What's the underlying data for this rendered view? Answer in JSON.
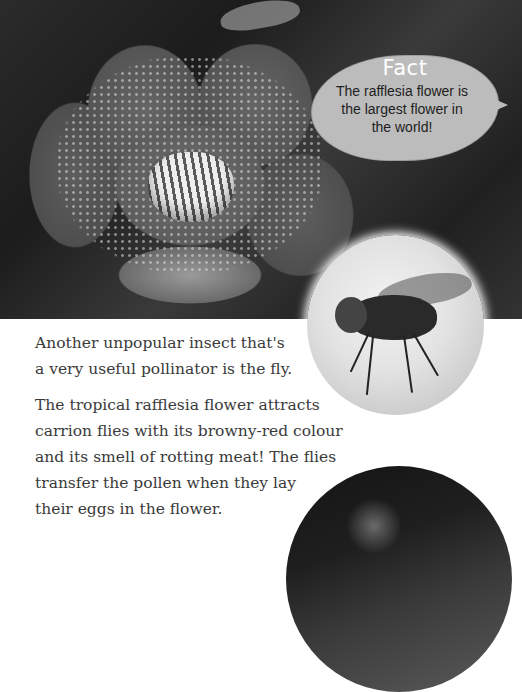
{
  "fact_box": {
    "title": "Fact",
    "text": "The rafflesia flower is the largest flower in the world!",
    "lines": [
      "The rafflesia flower is",
      "the largest flower in",
      "the world!"
    ]
  },
  "images": {
    "top_photo": "rafflesia-flower-photo",
    "fly_photo": "housefly-photo",
    "bottom_photo": "fly-on-flower-photo"
  },
  "body": {
    "paragraphs": [
      {
        "text": "Another unpopular insect that's a very useful pollinator is the fly.",
        "lines": [
          "Another unpopular insect that's",
          "a very useful pollinator is the fly."
        ]
      },
      {
        "text": "The tropical rafflesia flower attracts carrion flies with its browny-red colour and its smell of rotting meat! The flies transfer the pollen when they lay their eggs in the flower.",
        "lines": [
          "The tropical rafflesia flower attracts",
          "carrion flies with its browny-red colour",
          "and its smell of rotting meat! The flies",
          "transfer the pollen when they lay",
          "their eggs in the flower."
        ]
      }
    ]
  },
  "colors": {
    "text": "#3a3a3a",
    "leaf": "#bcbcbc",
    "fact_title": "#ffffff",
    "background": "#ffffff"
  }
}
